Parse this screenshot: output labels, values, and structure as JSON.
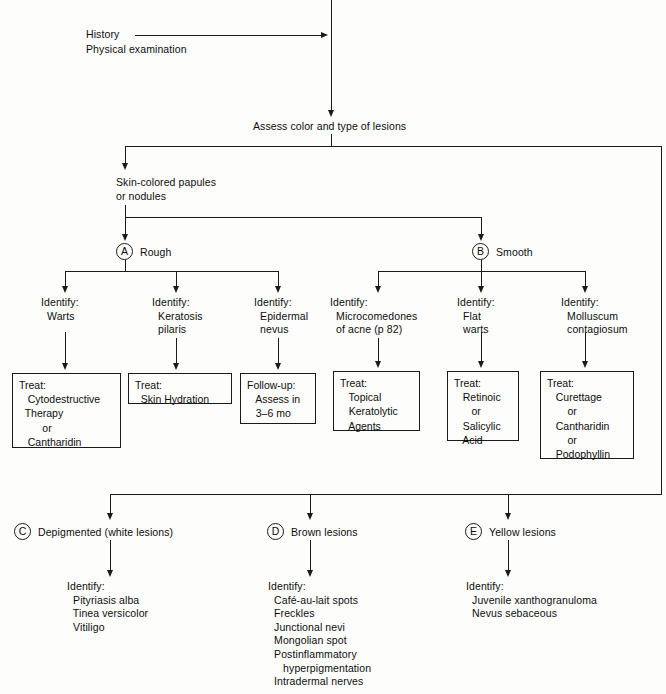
{
  "diagram": {
    "entry": {
      "line1": "History",
      "line2": "Physical examination"
    },
    "assess_node": "Assess color and type of lesions",
    "skin_colored": {
      "line1": "Skin-colored papules",
      "line2": "or nodules"
    },
    "branches": {
      "a": {
        "marker": "A",
        "label": "Rough"
      },
      "b": {
        "marker": "B",
        "label": "Smooth"
      },
      "c": {
        "marker": "C",
        "label": "Depigmented (white lesions)"
      },
      "d": {
        "marker": "D",
        "label": "Brown lesions"
      },
      "e": {
        "marker": "E",
        "label": "Yellow lesions"
      }
    },
    "identify_label": "Identify:",
    "rough_paths": [
      {
        "identify": "Identify:\n  Warts",
        "box": "Treat:\n   Cytodestructive\n  Therapy\n        or\n   Cantharidin"
      },
      {
        "identify": "Identify:\n  Keratosis\n  pilaris",
        "box": "Treat:\n  Skin Hydration"
      },
      {
        "identify": "Identify:\n  Epidermal\n  nevus",
        "box": "Follow-up:\n   Assess in\n   3–6 mo"
      }
    ],
    "smooth_paths": [
      {
        "identify": "Identify:\n  Microcomedones\n  of acne (p 82)",
        "box": "Treat:\n   Topical\n   Keratolytic\n   Agents"
      },
      {
        "identify": "Identify:\n  Flat\n  warts",
        "box": "Treat:\n   Retinoic\n      or\n   Salicylic\n   Acid"
      },
      {
        "identify": "Identify:\n  Molluscum\n  contagiosum",
        "box": "Treat:\n   Curettage\n       or\n   Cantharidin\n       or\n   Podophyllin"
      }
    ],
    "color_paths": [
      {
        "marker": "C",
        "identify": "Identify:\n  Pityriasis alba\n  Tinea versicolor\n  Vitiligo"
      },
      {
        "marker": "D",
        "identify": "Identify:\n  Café-au-lait spots\n  Freckles\n  Junctional nevi\n  Mongolian spot\n  Postinflammatory\n     hyperpigmentation\n  Intradermal nerves"
      },
      {
        "marker": "E",
        "identify": "Identify:\n  Juvenile xanthogranuloma\n  Nevus sebaceous"
      }
    ],
    "colors": {
      "ink": "#1a1a1a",
      "paper": "#fdfdfc"
    }
  }
}
